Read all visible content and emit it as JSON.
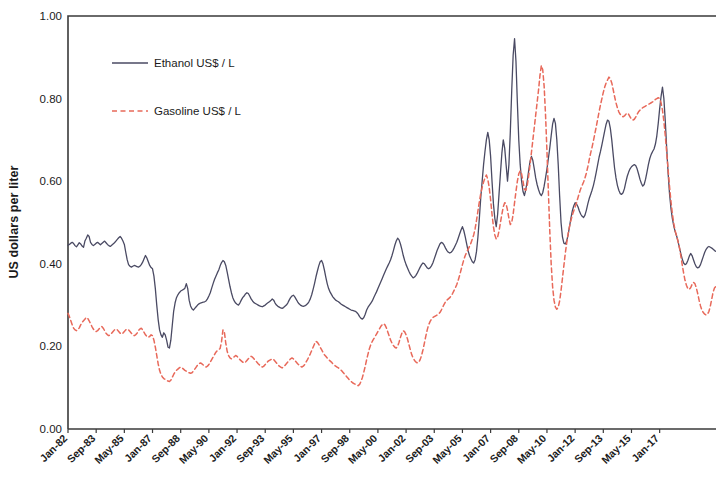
{
  "chart_data": {
    "type": "line",
    "title": "",
    "xlabel": "",
    "ylabel": "US dollars per liter",
    "ylim": [
      0.0,
      1.0
    ],
    "y_ticks": [
      "0.00",
      "0.20",
      "0.40",
      "0.60",
      "0.80",
      "1.00"
    ],
    "y_tick_values": [
      0.0,
      0.2,
      0.4,
      0.6,
      0.8,
      1.0
    ],
    "grid": false,
    "legend_position": "top-left-inside",
    "x_tick_labels": [
      "Jan-82",
      "Sep-83",
      "May-85",
      "Jan-87",
      "Sep-88",
      "May-90",
      "Jan-92",
      "Sep-93",
      "May-95",
      "Jan-97",
      "Sep-98",
      "May-00",
      "Jan-02",
      "Sep-03",
      "May-05",
      "Jan-07",
      "Sep-08",
      "May-10",
      "Jan-12",
      "Sep-13",
      "May-15",
      "Jan-17"
    ],
    "x_tick_indices": [
      0,
      20,
      40,
      60,
      80,
      100,
      120,
      140,
      160,
      180,
      200,
      220,
      240,
      260,
      280,
      300,
      320,
      340,
      360,
      380,
      400,
      420
    ],
    "x_start": "Jan-82",
    "x_end": "Jan-17",
    "x_interval": "monthly",
    "n_points": 421,
    "series": [
      {
        "name": "Ethanol US$ / L",
        "color": "#4a4a63",
        "style": "solid",
        "values": [
          0.445,
          0.447,
          0.45,
          0.452,
          0.449,
          0.444,
          0.441,
          0.446,
          0.451,
          0.448,
          0.443,
          0.44,
          0.455,
          0.462,
          0.47,
          0.466,
          0.452,
          0.447,
          0.444,
          0.447,
          0.45,
          0.452,
          0.449,
          0.446,
          0.449,
          0.452,
          0.455,
          0.451,
          0.447,
          0.444,
          0.442,
          0.445,
          0.448,
          0.451,
          0.455,
          0.459,
          0.463,
          0.466,
          0.462,
          0.455,
          0.447,
          0.428,
          0.41,
          0.398,
          0.394,
          0.392,
          0.394,
          0.396,
          0.395,
          0.393,
          0.392,
          0.394,
          0.398,
          0.404,
          0.412,
          0.42,
          0.414,
          0.405,
          0.396,
          0.391,
          0.388,
          0.37,
          0.34,
          0.3,
          0.265,
          0.24,
          0.228,
          0.222,
          0.233,
          0.228,
          0.215,
          0.198,
          0.196,
          0.215,
          0.25,
          0.285,
          0.305,
          0.318,
          0.325,
          0.33,
          0.334,
          0.336,
          0.338,
          0.341,
          0.352,
          0.34,
          0.312,
          0.298,
          0.291,
          0.288,
          0.292,
          0.296,
          0.3,
          0.303,
          0.305,
          0.306,
          0.307,
          0.308,
          0.31,
          0.315,
          0.322,
          0.33,
          0.341,
          0.352,
          0.362,
          0.37,
          0.378,
          0.385,
          0.395,
          0.403,
          0.408,
          0.405,
          0.396,
          0.38,
          0.362,
          0.345,
          0.33,
          0.318,
          0.31,
          0.305,
          0.302,
          0.3,
          0.305,
          0.312,
          0.318,
          0.322,
          0.327,
          0.33,
          0.328,
          0.322,
          0.315,
          0.31,
          0.306,
          0.304,
          0.302,
          0.3,
          0.298,
          0.297,
          0.296,
          0.298,
          0.3,
          0.303,
          0.306,
          0.308,
          0.311,
          0.315,
          0.312,
          0.305,
          0.3,
          0.297,
          0.295,
          0.293,
          0.292,
          0.294,
          0.297,
          0.3,
          0.305,
          0.312,
          0.318,
          0.322,
          0.324,
          0.32,
          0.314,
          0.308,
          0.303,
          0.3,
          0.298,
          0.297,
          0.298,
          0.3,
          0.303,
          0.308,
          0.315,
          0.325,
          0.338,
          0.352,
          0.368,
          0.382,
          0.395,
          0.405,
          0.408,
          0.4,
          0.385,
          0.368,
          0.352,
          0.34,
          0.332,
          0.326,
          0.32,
          0.316,
          0.312,
          0.31,
          0.308,
          0.305,
          0.302,
          0.3,
          0.298,
          0.296,
          0.294,
          0.292,
          0.29,
          0.288,
          0.287,
          0.286,
          0.285,
          0.282,
          0.278,
          0.272,
          0.268,
          0.266,
          0.27,
          0.278,
          0.288,
          0.295,
          0.3,
          0.305,
          0.31,
          0.318,
          0.325,
          0.332,
          0.34,
          0.348,
          0.356,
          0.364,
          0.372,
          0.38,
          0.388,
          0.395,
          0.402,
          0.41,
          0.42,
          0.432,
          0.445,
          0.455,
          0.462,
          0.458,
          0.448,
          0.435,
          0.42,
          0.408,
          0.398,
          0.39,
          0.382,
          0.375,
          0.37,
          0.366,
          0.368,
          0.372,
          0.378,
          0.385,
          0.392,
          0.398,
          0.402,
          0.4,
          0.395,
          0.39,
          0.388,
          0.39,
          0.395,
          0.402,
          0.412,
          0.422,
          0.432,
          0.44,
          0.448,
          0.452,
          0.45,
          0.445,
          0.438,
          0.432,
          0.428,
          0.426,
          0.428,
          0.432,
          0.438,
          0.445,
          0.452,
          0.462,
          0.472,
          0.482,
          0.49,
          0.48,
          0.465,
          0.448,
          0.432,
          0.42,
          0.412,
          0.405,
          0.402,
          0.41,
          0.43,
          0.465,
          0.51,
          0.56,
          0.6,
          0.64,
          0.672,
          0.7,
          0.718,
          0.7,
          0.66,
          0.6,
          0.545,
          0.51,
          0.49,
          0.52,
          0.57,
          0.62,
          0.668,
          0.7,
          0.68,
          0.64,
          0.6,
          0.64,
          0.72,
          0.82,
          0.905,
          0.945,
          0.89,
          0.79,
          0.7,
          0.64,
          0.6,
          0.575,
          0.565,
          0.58,
          0.6,
          0.625,
          0.648,
          0.66,
          0.65,
          0.63,
          0.608,
          0.592,
          0.58,
          0.57,
          0.565,
          0.572,
          0.588,
          0.608,
          0.63,
          0.655,
          0.68,
          0.71,
          0.738,
          0.752,
          0.74,
          0.7,
          0.64,
          0.565,
          0.5,
          0.465,
          0.45,
          0.448,
          0.455,
          0.47,
          0.49,
          0.51,
          0.528,
          0.54,
          0.548,
          0.545,
          0.538,
          0.528,
          0.52,
          0.515,
          0.512,
          0.518,
          0.53,
          0.545,
          0.558,
          0.568,
          0.578,
          0.59,
          0.605,
          0.622,
          0.64,
          0.658,
          0.672,
          0.688,
          0.705,
          0.722,
          0.738,
          0.748,
          0.745,
          0.728,
          0.7,
          0.665,
          0.632,
          0.608,
          0.59,
          0.578,
          0.57,
          0.568,
          0.572,
          0.582,
          0.598,
          0.612,
          0.622,
          0.63,
          0.635,
          0.638,
          0.64,
          0.638,
          0.63,
          0.618,
          0.605,
          0.595,
          0.588,
          0.592,
          0.605,
          0.622,
          0.64,
          0.655,
          0.665,
          0.672,
          0.678,
          0.69,
          0.71,
          0.74,
          0.775,
          0.805,
          0.828,
          0.8,
          0.745,
          0.68,
          0.62,
          0.57,
          0.535,
          0.51,
          0.492,
          0.478,
          0.468,
          0.455,
          0.44,
          0.425,
          0.412,
          0.402,
          0.398,
          0.4,
          0.408,
          0.418,
          0.425,
          0.42,
          0.41,
          0.4,
          0.393,
          0.39,
          0.392,
          0.398,
          0.408,
          0.418,
          0.428,
          0.435,
          0.44,
          0.442,
          0.44,
          0.438,
          0.435,
          0.432,
          0.43
        ]
      },
      {
        "name": "Gasoline US$ / L",
        "color": "#e8695a",
        "style": "dashed",
        "values": [
          0.28,
          0.272,
          0.262,
          0.252,
          0.244,
          0.24,
          0.238,
          0.24,
          0.245,
          0.252,
          0.258,
          0.262,
          0.266,
          0.27,
          0.268,
          0.262,
          0.255,
          0.248,
          0.242,
          0.238,
          0.236,
          0.238,
          0.242,
          0.246,
          0.248,
          0.244,
          0.238,
          0.232,
          0.228,
          0.226,
          0.228,
          0.232,
          0.236,
          0.24,
          0.242,
          0.24,
          0.236,
          0.232,
          0.23,
          0.232,
          0.236,
          0.24,
          0.242,
          0.24,
          0.236,
          0.232,
          0.228,
          0.226,
          0.228,
          0.232,
          0.238,
          0.242,
          0.244,
          0.24,
          0.234,
          0.228,
          0.224,
          0.222,
          0.224,
          0.228,
          0.226,
          0.215,
          0.198,
          0.178,
          0.158,
          0.142,
          0.132,
          0.126,
          0.122,
          0.12,
          0.118,
          0.116,
          0.115,
          0.118,
          0.125,
          0.132,
          0.138,
          0.142,
          0.145,
          0.148,
          0.15,
          0.148,
          0.145,
          0.142,
          0.14,
          0.138,
          0.136,
          0.135,
          0.136,
          0.14,
          0.145,
          0.15,
          0.155,
          0.158,
          0.16,
          0.158,
          0.155,
          0.152,
          0.15,
          0.152,
          0.156,
          0.162,
          0.168,
          0.174,
          0.18,
          0.186,
          0.19,
          0.192,
          0.195,
          0.212,
          0.24,
          0.235,
          0.208,
          0.188,
          0.178,
          0.172,
          0.17,
          0.172,
          0.175,
          0.178,
          0.176,
          0.172,
          0.168,
          0.165,
          0.162,
          0.16,
          0.162,
          0.166,
          0.17,
          0.174,
          0.176,
          0.174,
          0.17,
          0.166,
          0.162,
          0.158,
          0.155,
          0.152,
          0.15,
          0.152,
          0.156,
          0.16,
          0.164,
          0.166,
          0.168,
          0.17,
          0.168,
          0.164,
          0.16,
          0.156,
          0.152,
          0.15,
          0.148,
          0.15,
          0.154,
          0.158,
          0.162,
          0.166,
          0.17,
          0.172,
          0.17,
          0.166,
          0.162,
          0.158,
          0.155,
          0.152,
          0.15,
          0.152,
          0.156,
          0.162,
          0.168,
          0.175,
          0.182,
          0.19,
          0.198,
          0.206,
          0.212,
          0.21,
          0.205,
          0.198,
          0.192,
          0.186,
          0.18,
          0.176,
          0.172,
          0.168,
          0.165,
          0.162,
          0.158,
          0.155,
          0.152,
          0.15,
          0.148,
          0.145,
          0.142,
          0.138,
          0.134,
          0.13,
          0.126,
          0.122,
          0.118,
          0.115,
          0.112,
          0.11,
          0.108,
          0.106,
          0.105,
          0.108,
          0.115,
          0.125,
          0.138,
          0.152,
          0.168,
          0.182,
          0.195,
          0.205,
          0.212,
          0.218,
          0.224,
          0.23,
          0.236,
          0.242,
          0.248,
          0.252,
          0.255,
          0.252,
          0.245,
          0.235,
          0.225,
          0.215,
          0.208,
          0.202,
          0.198,
          0.196,
          0.2,
          0.21,
          0.222,
          0.232,
          0.238,
          0.235,
          0.228,
          0.218,
          0.205,
          0.192,
          0.18,
          0.172,
          0.166,
          0.162,
          0.16,
          0.162,
          0.168,
          0.178,
          0.192,
          0.208,
          0.225,
          0.24,
          0.252,
          0.26,
          0.266,
          0.27,
          0.272,
          0.274,
          0.276,
          0.278,
          0.282,
          0.288,
          0.295,
          0.302,
          0.308,
          0.312,
          0.315,
          0.318,
          0.322,
          0.328,
          0.335,
          0.342,
          0.35,
          0.36,
          0.372,
          0.385,
          0.398,
          0.41,
          0.42,
          0.428,
          0.435,
          0.442,
          0.45,
          0.46,
          0.47,
          0.485,
          0.505,
          0.528,
          0.55,
          0.57,
          0.585,
          0.598,
          0.608,
          0.615,
          0.605,
          0.585,
          0.555,
          0.52,
          0.49,
          0.47,
          0.46,
          0.465,
          0.48,
          0.5,
          0.52,
          0.538,
          0.548,
          0.545,
          0.53,
          0.51,
          0.495,
          0.5,
          0.52,
          0.548,
          0.575,
          0.6,
          0.618,
          0.625,
          0.618,
          0.6,
          0.58,
          0.578,
          0.59,
          0.612,
          0.64,
          0.67,
          0.7,
          0.73,
          0.76,
          0.79,
          0.82,
          0.855,
          0.88,
          0.87,
          0.83,
          0.76,
          0.672,
          0.575,
          0.48,
          0.4,
          0.345,
          0.312,
          0.295,
          0.29,
          0.295,
          0.31,
          0.335,
          0.365,
          0.395,
          0.425,
          0.45,
          0.472,
          0.49,
          0.505,
          0.518,
          0.528,
          0.538,
          0.548,
          0.56,
          0.572,
          0.582,
          0.59,
          0.598,
          0.608,
          0.62,
          0.635,
          0.652,
          0.668,
          0.682,
          0.698,
          0.715,
          0.732,
          0.75,
          0.768,
          0.785,
          0.8,
          0.815,
          0.828,
          0.838,
          0.845,
          0.852,
          0.848,
          0.838,
          0.822,
          0.805,
          0.79,
          0.778,
          0.768,
          0.762,
          0.758,
          0.756,
          0.758,
          0.762,
          0.765,
          0.762,
          0.756,
          0.75,
          0.748,
          0.75,
          0.755,
          0.762,
          0.768,
          0.772,
          0.775,
          0.778,
          0.78,
          0.782,
          0.784,
          0.786,
          0.788,
          0.79,
          0.792,
          0.795,
          0.798,
          0.8,
          0.802,
          0.8,
          0.79,
          0.772,
          0.745,
          0.71,
          0.67,
          0.628,
          0.588,
          0.552,
          0.522,
          0.498,
          0.48,
          0.468,
          0.455,
          0.44,
          0.42,
          0.398,
          0.378,
          0.36,
          0.348,
          0.34,
          0.338,
          0.342,
          0.35,
          0.355,
          0.352,
          0.342,
          0.328,
          0.312,
          0.298,
          0.288,
          0.282,
          0.278,
          0.276,
          0.278,
          0.285,
          0.298,
          0.315,
          0.332,
          0.342,
          0.345
        ]
      }
    ]
  },
  "legend": {
    "items": [
      {
        "label": "Ethanol US$ / L",
        "color": "#4a4a63",
        "style": "solid"
      },
      {
        "label": "Gasoline US$ / L",
        "color": "#e8695a",
        "style": "dashed"
      }
    ]
  },
  "axes": {
    "y_title": "US dollars per liter"
  }
}
